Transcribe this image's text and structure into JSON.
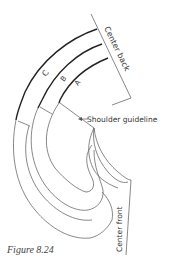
{
  "figure": {
    "caption": "Figure 8.24",
    "labels": {
      "center_back": "Center back",
      "center_front": "Center front",
      "shoulder_guideline": "Shoulder guideline",
      "band_a": "A",
      "band_b": "B",
      "band_c": "C"
    },
    "colors": {
      "line": "#555555",
      "bold_line": "#222222",
      "text": "#333333"
    }
  }
}
